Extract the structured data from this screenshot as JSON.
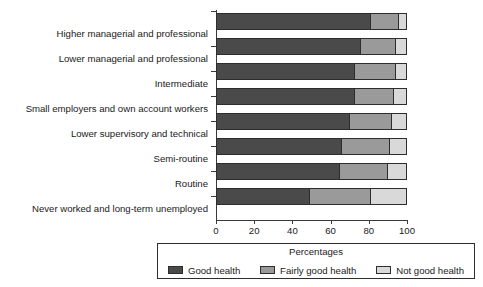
{
  "chart_data": {
    "type": "bar",
    "orientation": "horizontal",
    "stacked": true,
    "stack_mode": "percent",
    "title": "",
    "subtitle": "",
    "xlabel": "Percentages",
    "ylabel": "",
    "xlim": [
      0,
      100
    ],
    "xticks": [
      0,
      20,
      40,
      60,
      80,
      100
    ],
    "xtick_labels": [
      "0",
      "20",
      "40",
      "60",
      "80",
      "100"
    ],
    "grid": false,
    "legend_position": "bottom",
    "legend_title": "Percentages",
    "categories": [
      "Higher managerial and professional",
      "Lower managerial and professional",
      "Intermediate",
      "Small employers and own account workers",
      "Lower supervisory and technical",
      "Semi-routine",
      "Routine",
      "Never worked and long-term unemployed"
    ],
    "series": [
      {
        "name": "Good health",
        "color": "#4a4a4a",
        "values": [
          81,
          76,
          73,
          73,
          70,
          66,
          65,
          49
        ]
      },
      {
        "name": "Fairly good health",
        "color": "#9a9a9a",
        "values": [
          15,
          18,
          21,
          20,
          22,
          25,
          25,
          32
        ]
      },
      {
        "name": "Not good health",
        "color": "#d9d9d9",
        "values": [
          4,
          6,
          6,
          7,
          8,
          9,
          10,
          19
        ]
      }
    ]
  },
  "colors": {
    "good_health": "#4a4a4a",
    "fairly_good_health": "#9a9a9a",
    "not_good_health": "#d9d9d9",
    "axis": "#3a3a3a",
    "outline": "#2d2d2d",
    "background": "#ffffff"
  }
}
